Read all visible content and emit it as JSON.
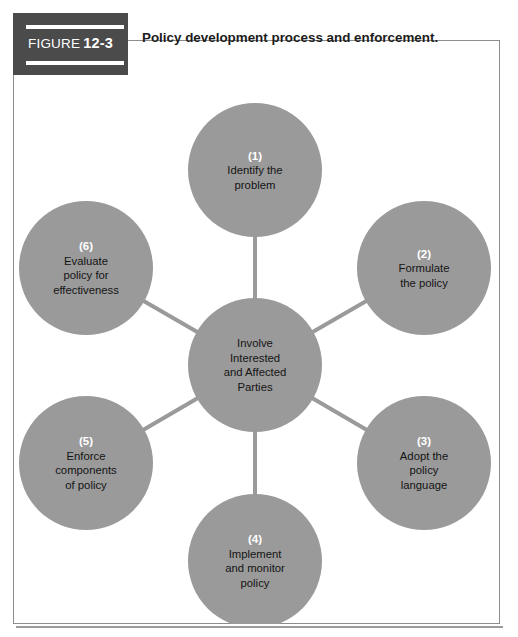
{
  "figure": {
    "banner_word": "FIGURE",
    "banner_number": "12-3",
    "title": "Policy development process and enforcement."
  },
  "colors": {
    "circle_fill": "#9a9a9a",
    "connector": "#9a9a9a",
    "banner_bg": "#4b4b4b",
    "frame_border": "#8d8d8d",
    "number_text": "#ffffff",
    "body_text": "#141414",
    "page_bg": "#ffffff"
  },
  "chart_data": {
    "type": "diagram",
    "layout": "hub-and-spoke",
    "title": "Policy development process and enforcement.",
    "hub": {
      "id": "hub",
      "lines": [
        "Involve",
        "Interested",
        "and Affected",
        "Parties"
      ],
      "cx": 242,
      "cy": 325,
      "r": 67
    },
    "nodes": [
      {
        "id": "step-1",
        "number": "(1)",
        "lines": [
          "Identify the",
          "problem"
        ],
        "cx": 242,
        "cy": 130,
        "r": 67,
        "angle_deg": 270
      },
      {
        "id": "step-2",
        "number": "(2)",
        "lines": [
          "Formulate",
          "the policy"
        ],
        "cx": 411,
        "cy": 228,
        "r": 67,
        "angle_deg": 330
      },
      {
        "id": "step-3",
        "number": "(3)",
        "lines": [
          "Adopt the",
          "policy",
          "language"
        ],
        "cx": 411,
        "cy": 423,
        "r": 67,
        "angle_deg": 30
      },
      {
        "id": "step-4",
        "number": "(4)",
        "lines": [
          "Implement",
          "and monitor",
          "policy"
        ],
        "cx": 242,
        "cy": 521,
        "r": 67,
        "angle_deg": 90
      },
      {
        "id": "step-5",
        "number": "(5)",
        "lines": [
          "Enforce",
          "components",
          "of policy"
        ],
        "cx": 73,
        "cy": 423,
        "r": 67,
        "angle_deg": 150
      },
      {
        "id": "step-6",
        "number": "(6)",
        "lines": [
          "Evaluate",
          "policy for",
          "effectiveness"
        ],
        "cx": 73,
        "cy": 228,
        "r": 67,
        "angle_deg": 210
      }
    ],
    "connectors": [
      {
        "from": "hub",
        "to": "step-1"
      },
      {
        "from": "hub",
        "to": "step-2"
      },
      {
        "from": "hub",
        "to": "step-3"
      },
      {
        "from": "hub",
        "to": "step-4"
      },
      {
        "from": "hub",
        "to": "step-5"
      },
      {
        "from": "hub",
        "to": "step-6"
      }
    ]
  }
}
